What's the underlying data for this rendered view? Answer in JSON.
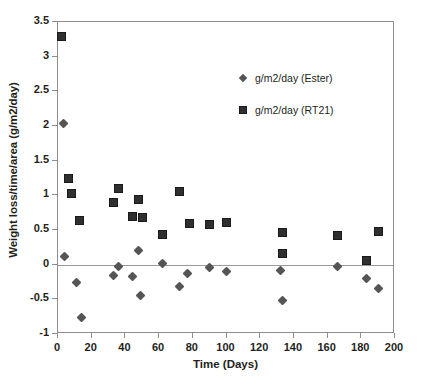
{
  "chart_data": {
    "type": "scatter",
    "title": "",
    "xlabel": "Time (Days)",
    "ylabel": "Weight loss/time/area (g/m2/day)",
    "xlim": [
      0,
      200
    ],
    "ylim": [
      -1,
      3.5
    ],
    "xticks": [
      "0",
      "20",
      "40",
      "60",
      "80",
      "100",
      "120",
      "140",
      "160",
      "180",
      "200"
    ],
    "yticks": [
      "-1",
      "-0.5",
      "0",
      "0.5",
      "1",
      "1.5",
      "2",
      "2.5",
      "3",
      "3.5"
    ],
    "grid": false,
    "legend_position": "upper right",
    "zero_line": 0,
    "series": [
      {
        "name": "g/m2/day (Ester)",
        "marker": "diamond",
        "color": "#555555",
        "points": [
          [
            3,
            2.03
          ],
          [
            4,
            0.12
          ],
          [
            11,
            -0.25
          ],
          [
            14,
            -0.76
          ],
          [
            33,
            -0.15
          ],
          [
            36,
            -0.03
          ],
          [
            44,
            -0.17
          ],
          [
            48,
            0.21
          ],
          [
            49,
            -0.44
          ],
          [
            62,
            0.01
          ],
          [
            72,
            -0.32
          ],
          [
            77,
            -0.13
          ],
          [
            90,
            -0.04
          ],
          [
            100,
            -0.1
          ],
          [
            132,
            -0.09
          ],
          [
            133,
            -0.51
          ],
          [
            166,
            -0.02
          ],
          [
            183,
            -0.2
          ],
          [
            190,
            -0.35
          ]
        ]
      },
      {
        "name": "g/m2/day (RT21)",
        "marker": "square",
        "color": "#2f2f2f",
        "points": [
          [
            2,
            3.29
          ],
          [
            6,
            1.25
          ],
          [
            8,
            1.03
          ],
          [
            13,
            0.63
          ],
          [
            33,
            0.9
          ],
          [
            36,
            1.1
          ],
          [
            44,
            0.7
          ],
          [
            48,
            0.94
          ],
          [
            50,
            0.68
          ],
          [
            62,
            0.44
          ],
          [
            72,
            1.05
          ],
          [
            78,
            0.6
          ],
          [
            90,
            0.58
          ],
          [
            100,
            0.61
          ],
          [
            133,
            0.47
          ],
          [
            133,
            0.16
          ],
          [
            166,
            0.42
          ],
          [
            183,
            0.06
          ],
          [
            190,
            0.48
          ]
        ]
      }
    ]
  },
  "legend": {
    "entries": [
      {
        "label": "g/m2/day (Ester)",
        "marker": "diamond"
      },
      {
        "label": "g/m2/day (RT21)",
        "marker": "square"
      }
    ]
  }
}
